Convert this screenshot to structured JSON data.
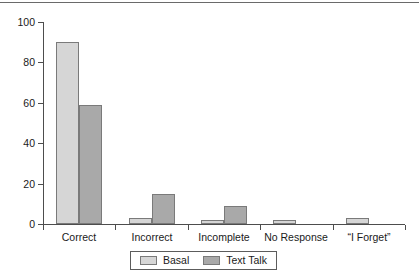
{
  "chart_data": {
    "type": "bar",
    "title": "",
    "subtitle": "",
    "xlabel": "",
    "ylabel": "",
    "ylim": [
      0,
      100
    ],
    "yticks": [
      0,
      20,
      40,
      60,
      80,
      100
    ],
    "grid": false,
    "legend_position": "bottom",
    "categories": [
      "Correct",
      "Incorrect",
      "Incomplete",
      "No Response",
      "“I  Forget”"
    ],
    "series": [
      {
        "name": "Basal",
        "color": "#d6d6d6",
        "values": [
          90,
          3,
          2,
          2,
          3
        ]
      },
      {
        "name": "Text Talk",
        "color": "#a8a8a8",
        "values": [
          59,
          15,
          9,
          0,
          0
        ]
      }
    ]
  },
  "legend": {
    "entries": [
      {
        "label": "Basal",
        "swatch": "legend-swatch-basal"
      },
      {
        "label": "Text Talk",
        "swatch": "legend-swatch-text-talk"
      }
    ]
  },
  "axis": {
    "y_tick_labels": [
      "0",
      "20",
      "40",
      "60",
      "80",
      "100"
    ],
    "x_tick_labels": [
      "Correct",
      "Incorrect",
      "Incomplete",
      "No Response",
      "“I  Forget”"
    ]
  }
}
